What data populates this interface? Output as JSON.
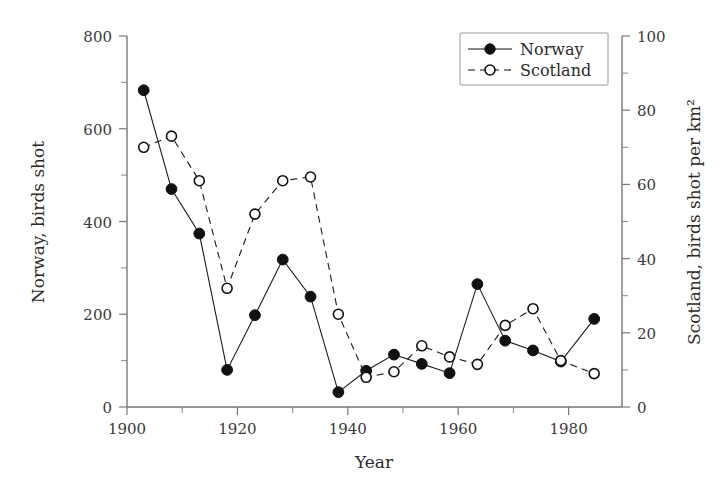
{
  "chart_data": {
    "type": "line",
    "title": "",
    "subtitle": "",
    "xlabel": "Year",
    "ylabel": "Norway, birds shot",
    "y2label": "Scotland, birds shot per km²",
    "xlim": [
      1900,
      1989
    ],
    "ylim": [
      0,
      800
    ],
    "y2lim": [
      0,
      100
    ],
    "grid": false,
    "legend_position": "top-right",
    "xticks": [
      1900,
      1920,
      1940,
      1960,
      1980
    ],
    "xticklabels": [
      "1900",
      "1920",
      "1940",
      "1960",
      "1980"
    ],
    "xminorticks": [
      1910,
      1930,
      1950,
      1970
    ],
    "yticks": [
      0,
      200,
      400,
      600,
      800
    ],
    "yticklabels": [
      "0",
      "200",
      "400",
      "600",
      "800"
    ],
    "yminorticks": [
      100,
      300,
      500,
      700
    ],
    "y2ticks": [
      0,
      20,
      40,
      60,
      80,
      100
    ],
    "y2ticklabels": [
      "0",
      "20",
      "40",
      "60",
      "80",
      "100"
    ],
    "y2minorticks": [
      10,
      30,
      50,
      70,
      90
    ],
    "series": [
      {
        "name": "Norway",
        "axis": "left",
        "marker": "filled-circle",
        "linestyle": "solid",
        "color": "#111111",
        "x": [
          1903,
          1908,
          1913,
          1918,
          1923,
          1928,
          1933,
          1938,
          1943,
          1948,
          1953,
          1958,
          1963,
          1968,
          1973,
          1978,
          1984
        ],
        "values": [
          683,
          470,
          374,
          80,
          198,
          318,
          238,
          32,
          78,
          113,
          93,
          73,
          265,
          143,
          122,
          98,
          190
        ]
      },
      {
        "name": "Scotland",
        "axis": "right",
        "marker": "open-circle",
        "linestyle": "dashed",
        "color": "#111111",
        "x": [
          1903,
          1908,
          1913,
          1918,
          1923,
          1928,
          1933,
          1938,
          1943,
          1948,
          1953,
          1958,
          1963,
          1968,
          1973,
          1978,
          1984
        ],
        "values": [
          70,
          73,
          61,
          32,
          52,
          61,
          62,
          25,
          8,
          9.5,
          16.5,
          13.5,
          11.5,
          22,
          26.5,
          12.5,
          9
        ]
      }
    ],
    "legend": [
      {
        "label": "Norway",
        "marker": "filled-circle",
        "linestyle": "solid"
      },
      {
        "label": "Scotland",
        "marker": "open-circle",
        "linestyle": "dashed"
      }
    ]
  },
  "axes": {
    "left_title": "Norway, birds shot",
    "right_title": "Scotland, birds shot per km²",
    "bottom_title": "Year"
  }
}
